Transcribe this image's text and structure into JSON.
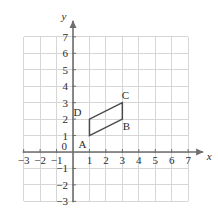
{
  "figure": {
    "background_color": "#ffffff",
    "grid_color": "#d6d6d6",
    "axis_color": "#6e6e6e",
    "shape_color": "#4a4a4a",
    "text_color": "#2b2b2b"
  },
  "axes": {
    "x_axis_name": "x",
    "y_axis_name": "y",
    "x_min": -3,
    "x_max": 7,
    "y_min": -3,
    "y_max": 7,
    "grid": true,
    "x_tick_labels": [
      "−3",
      "−2",
      "−1",
      "0",
      "1",
      "2",
      "3",
      "4",
      "5",
      "6",
      "7"
    ],
    "x_tick_values": [
      -3,
      -2,
      -1,
      0,
      1,
      2,
      3,
      4,
      5,
      6,
      7
    ],
    "y_tick_labels": [
      "7",
      "6",
      "5",
      "4",
      "3",
      "2",
      "1",
      "0",
      "−1",
      "−2",
      "−3"
    ],
    "y_tick_values": [
      7,
      6,
      5,
      4,
      3,
      2,
      1,
      0,
      -1,
      -2,
      -3
    ],
    "origin_label": "0"
  },
  "chart_data": {
    "type": "scatter",
    "title": "",
    "xlabel": "x",
    "ylabel": "y",
    "xlim": [
      -3,
      7
    ],
    "ylim": [
      -3,
      7
    ],
    "grid": true,
    "shapes": [
      {
        "name": "parallelogram-ABCD",
        "closed": true,
        "vertices": [
          {
            "label": "A",
            "x": 1,
            "y": 1,
            "label_dx": -7,
            "label_dy": 12
          },
          {
            "label": "B",
            "x": 3,
            "y": 2,
            "label_dx": 4,
            "label_dy": 11
          },
          {
            "label": "C",
            "x": 3,
            "y": 3,
            "label_dx": 3,
            "label_dy": -4
          },
          {
            "label": "D",
            "x": 1,
            "y": 2,
            "label_dx": -12,
            "label_dy": -3
          }
        ]
      }
    ]
  },
  "vertex_labels": {
    "a": "A",
    "b": "B",
    "c": "C",
    "d": "D"
  }
}
